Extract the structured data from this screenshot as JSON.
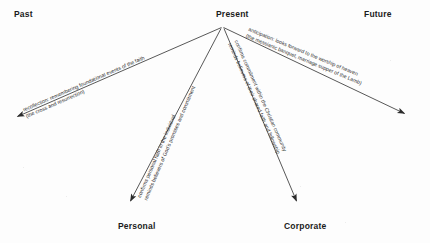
{
  "diagram": {
    "background_color": "#fdfdfd",
    "line_color": "#3a3a3a",
    "text_color": "#2a2a2a",
    "label_color": "#1b1b1b"
  },
  "axis_labels": {
    "past": "Past",
    "present": "Present",
    "future": "Future",
    "personal": "Personal",
    "corporate": "Corporate"
  },
  "annotations": {
    "recollection": {
      "line1": "recollection: remembering foundational events of the faith",
      "line2": "(the cross and resurrection)"
    },
    "anticipation": {
      "line1": "anticipation: looks forward to the worship of heaven",
      "line2": "(the messianic banquet, marriage supper of the Lamb)"
    },
    "personal": {
      "line1": "confirms personal faith in the individual",
      "line2": "reminds believers of God's promises and commitment"
    },
    "corporate": {
      "line1": "confirms commitment within the Christian community",
      "line2": "reminds believers of their shared faith and fellowship"
    }
  },
  "arrows": [
    {
      "name": "past-arrow",
      "direction": "down-left",
      "from": "present-origin",
      "to": "past"
    },
    {
      "name": "future-arrow",
      "direction": "down-right",
      "from": "present-origin",
      "to": "future"
    },
    {
      "name": "personal-arrow",
      "direction": "down-left",
      "from": "present-origin",
      "to": "personal"
    },
    {
      "name": "corporate-arrow",
      "direction": "down-right",
      "from": "present-origin",
      "to": "corporate"
    }
  ]
}
